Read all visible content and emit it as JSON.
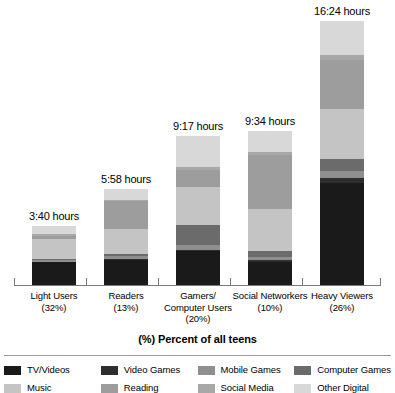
{
  "chart_data": {
    "type": "bar",
    "subtype": "stacked-bar",
    "title": "(%) Percent of all teens",
    "xlabel": "(%) Percent of all teens",
    "ylabel": "",
    "grid": false,
    "legend_position": "bottom",
    "axis_unit": "hours:minutes per day",
    "categories": [
      "Light Users",
      "Readers",
      "Gamers/ Computer Users",
      "Social Networkers",
      "Heavy Viewers"
    ],
    "category_percents": [
      "(32%)",
      "(13%)",
      "(20%)",
      "(10%)",
      "(26%)"
    ],
    "category_lines": [
      [
        "Light Users",
        "(32%)"
      ],
      [
        "Readers",
        "(13%)"
      ],
      [
        "Gamers/",
        "Computer Users",
        "(20%)"
      ],
      [
        "Social Networkers",
        "(10%)"
      ],
      [
        "Heavy Viewers",
        "(26%)"
      ]
    ],
    "totals_labels": [
      "3:40 hours",
      "5:58 hours",
      "9:17 hours",
      "9:34 hours",
      "16:24 hours"
    ],
    "totals_hours": [
      3.67,
      5.97,
      9.28,
      9.57,
      16.4
    ],
    "series": [
      {
        "name": "TV/Videos",
        "color": "#1a1a1a",
        "values": [
          1.4,
          1.55,
          2.1,
          1.45,
          6.35
        ]
      },
      {
        "name": "Video Games",
        "color": "#2e2e2e",
        "values": [
          0.05,
          0.08,
          0.1,
          0.08,
          0.3
        ]
      },
      {
        "name": "Mobile Games",
        "color": "#8f8f8f",
        "values": [
          0.1,
          0.18,
          0.3,
          0.22,
          0.45
        ]
      },
      {
        "name": "Computer Games",
        "color": "#6b6b6b",
        "values": [
          0.08,
          0.1,
          1.25,
          0.35,
          0.7
        ]
      },
      {
        "name": "Music",
        "color": "#c4c4c4",
        "values": [
          1.2,
          1.55,
          2.35,
          2.65,
          3.15
        ]
      },
      {
        "name": "Reading",
        "color": "#9d9d9d",
        "values": [
          0.22,
          1.75,
          1.05,
          3.3,
          3.05
        ]
      },
      {
        "name": "Social Media",
        "color": "#a8a8a8",
        "values": [
          0.12,
          0.1,
          0.18,
          0.22,
          0.3
        ]
      },
      {
        "name": "Other Digital",
        "color": "#d8d8d8",
        "values": [
          0.5,
          0.66,
          1.95,
          1.3,
          2.1
        ]
      }
    ]
  },
  "legend": {
    "items": [
      {
        "label": "TV/Videos",
        "color": "#1a1a1a"
      },
      {
        "label": "Video Games",
        "color": "#2e2e2e"
      },
      {
        "label": "Mobile Games",
        "color": "#8f8f8f"
      },
      {
        "label": "Computer Games",
        "color": "#6b6b6b"
      },
      {
        "label": "Music",
        "color": "#c4c4c4"
      },
      {
        "label": "Reading",
        "color": "#9d9d9d"
      },
      {
        "label": "Social Media",
        "color": "#a8a8a8"
      },
      {
        "label": "Other Digital",
        "color": "#d8d8d8"
      }
    ]
  },
  "axis": {
    "title": "(%) Percent of all teens",
    "line_color": "#7a7a7a"
  }
}
